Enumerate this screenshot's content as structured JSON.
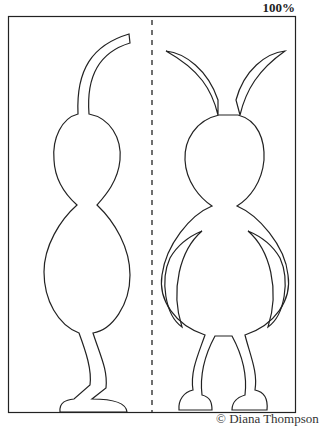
{
  "page": {
    "zoom_label": "100%",
    "credit": "© Diana Thompson"
  },
  "template": {
    "description": "Cut-out paper figure template: side view (left) and front view (right) of a two-segment bug with antennae, separated by dashed fold line",
    "panels": [
      "side-view-figure",
      "front-view-figure"
    ],
    "line_color": "#222222"
  }
}
